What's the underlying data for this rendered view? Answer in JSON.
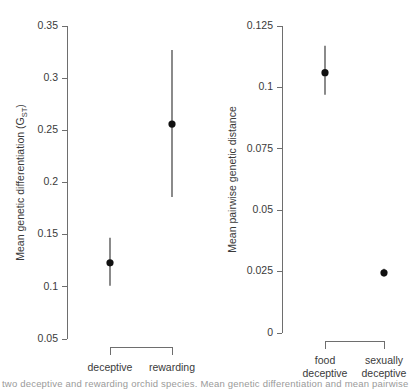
{
  "figure": {
    "caption_fragment": "two deceptive and rewarding orchid species. Mean genetic differentiation and mean pairwise"
  },
  "chart_data": [
    {
      "id": "panel-left",
      "type": "scatter",
      "title": "",
      "xlabel": "",
      "ylabel": "Mean genetic differentiation (G",
      "ylabel_subscript": "ST",
      "ylabel_suffix": ")",
      "categories": [
        "deceptive",
        "rewarding"
      ],
      "ylim": [
        0.05,
        0.35
      ],
      "yticks": [
        0.05,
        0.1,
        0.15,
        0.2,
        0.25,
        0.3,
        0.35
      ],
      "ytick_labels": [
        "0.05",
        "0.1",
        "0.15",
        "0.2",
        "0.25",
        "0.3",
        "0.35"
      ],
      "grid": false,
      "legend": "none",
      "error_bars": true,
      "points": [
        {
          "category": "deceptive",
          "value": 0.123,
          "lower": 0.101,
          "upper": 0.147
        },
        {
          "category": "rewarding",
          "value": 0.256,
          "lower": 0.186,
          "upper": 0.327
        }
      ],
      "bracket": true
    },
    {
      "id": "panel-right",
      "type": "scatter",
      "title": "",
      "xlabel": "",
      "ylabel": "Mean pairwise genetic distance",
      "categories": [
        "food deceptive",
        "sexually deceptive"
      ],
      "category_lines": [
        [
          "food",
          "deceptive"
        ],
        [
          "sexually",
          "deceptive"
        ]
      ],
      "ylim": [
        0,
        0.125
      ],
      "yticks": [
        0,
        0.025,
        0.05,
        0.075,
        0.1,
        0.125
      ],
      "ytick_labels": [
        "0",
        "0.025",
        "0.05",
        "0.075",
        "0.1",
        "0.125"
      ],
      "grid": false,
      "legend": "none",
      "error_bars": true,
      "points": [
        {
          "category": "food deceptive",
          "value": 0.106,
          "lower": 0.097,
          "upper": 0.117
        },
        {
          "category": "sexually deceptive",
          "value": 0.0245,
          "lower": 0.023,
          "upper": 0.0262
        }
      ],
      "bracket": true
    }
  ]
}
